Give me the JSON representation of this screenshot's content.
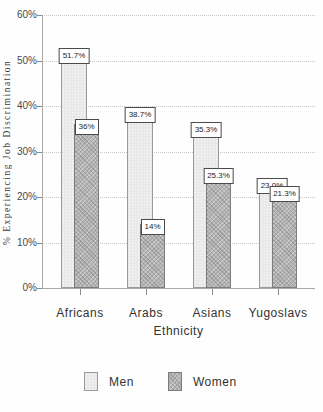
{
  "chart_data": {
    "type": "bar",
    "title": "",
    "categories": [
      "Africans",
      "Arabs",
      "Asians",
      "Yugoslavs"
    ],
    "series": [
      {
        "name": "Men",
        "values": [
          51.7,
          38.7,
          35.3,
          23.0
        ],
        "labels": [
          "51.7%",
          "38.7%",
          "35.3%",
          "23.0%"
        ],
        "color": "#e9e9e9",
        "pattern": "dots"
      },
      {
        "name": "Women",
        "values": [
          36,
          14,
          25.3,
          21.3
        ],
        "labels": [
          "36%",
          "14%",
          "25.3%",
          "21.3%"
        ],
        "color": "#b3b3b3",
        "pattern": "crosshatch"
      }
    ],
    "xlabel": "Ethnicity",
    "ylabel": "% Experiencing Job Discrimination",
    "ylim": [
      0,
      60
    ],
    "ytick_labels": [
      "0%",
      "10%",
      "20%",
      "30%",
      "40%",
      "50%",
      "60%"
    ],
    "grid": true,
    "gridline_color": "#c6c6c6",
    "legend_position": "bottom"
  }
}
